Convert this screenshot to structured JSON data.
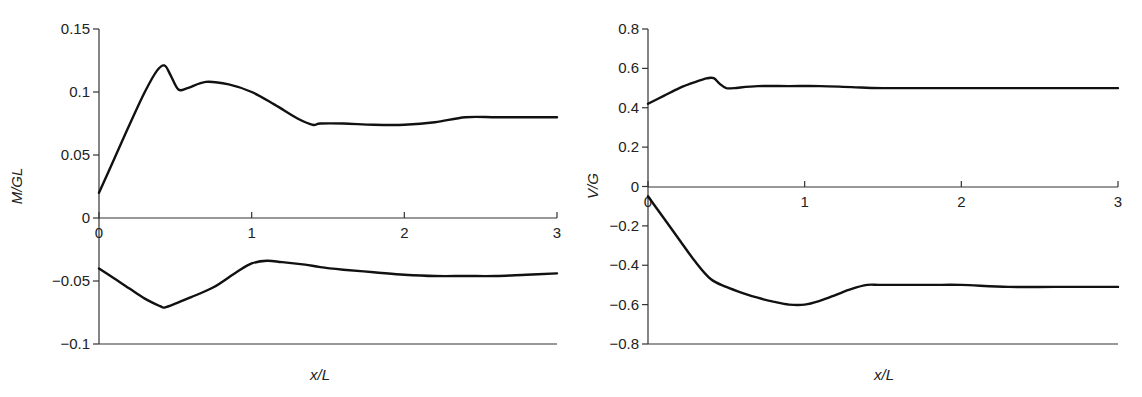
{
  "chart_data": [
    {
      "type": "line",
      "title": "",
      "xlabel": "x/L",
      "ylabel": "M/GL",
      "xlim": [
        0,
        3
      ],
      "ylim": [
        -0.1,
        0.15
      ],
      "x_ticks": [
        "0",
        "1",
        "2",
        "3"
      ],
      "y_ticks": [
        "0.15",
        "0.1",
        "0.05",
        "0",
        "−0.05",
        "−0.1"
      ],
      "grid": false,
      "legend": null,
      "series": [
        {
          "name": "upper",
          "x": [
            0,
            0.1,
            0.2,
            0.3,
            0.38,
            0.43,
            0.47,
            0.52,
            0.58,
            0.7,
            0.85,
            1.0,
            1.15,
            1.3,
            1.4,
            1.45,
            1.6,
            1.8,
            2.0,
            2.2,
            2.4,
            2.6,
            2.8,
            3.0
          ],
          "y": [
            0.02,
            0.047,
            0.074,
            0.1,
            0.117,
            0.121,
            0.113,
            0.102,
            0.103,
            0.108,
            0.106,
            0.1,
            0.09,
            0.079,
            0.074,
            0.075,
            0.075,
            0.074,
            0.074,
            0.076,
            0.08,
            0.08,
            0.08,
            0.08
          ]
        },
        {
          "name": "lower",
          "x": [
            0,
            0.1,
            0.2,
            0.3,
            0.4,
            0.43,
            0.5,
            0.6,
            0.75,
            0.9,
            1.0,
            1.1,
            1.2,
            1.35,
            1.45,
            1.6,
            1.8,
            2.0,
            2.2,
            2.4,
            2.6,
            2.8,
            3.0
          ],
          "y": [
            -0.04,
            -0.048,
            -0.056,
            -0.064,
            -0.07,
            -0.071,
            -0.068,
            -0.063,
            -0.055,
            -0.043,
            -0.036,
            -0.034,
            -0.035,
            -0.037,
            -0.039,
            -0.041,
            -0.043,
            -0.045,
            -0.046,
            -0.046,
            -0.046,
            -0.045,
            -0.044
          ]
        }
      ]
    },
    {
      "type": "line",
      "title": "",
      "xlabel": "x/L",
      "ylabel": "V/G",
      "xlim": [
        0,
        3
      ],
      "ylim": [
        -0.8,
        0.8
      ],
      "x_ticks": [
        "0",
        "1",
        "2",
        "3"
      ],
      "y_ticks": [
        "0.8",
        "0.6",
        "0.4",
        "0.2",
        "0",
        "−0.2",
        "−0.4",
        "−0.6",
        "−0.8"
      ],
      "grid": false,
      "legend": null,
      "series": [
        {
          "name": "upper",
          "x": [
            0,
            0.1,
            0.2,
            0.3,
            0.38,
            0.42,
            0.46,
            0.5,
            0.55,
            0.7,
            0.9,
            1.1,
            1.3,
            1.5,
            2.0,
            2.5,
            3.0
          ],
          "y": [
            0.42,
            0.46,
            0.5,
            0.53,
            0.55,
            0.55,
            0.52,
            0.5,
            0.5,
            0.51,
            0.51,
            0.51,
            0.505,
            0.5,
            0.5,
            0.5,
            0.5
          ]
        },
        {
          "name": "lower",
          "x": [
            0,
            0.1,
            0.2,
            0.3,
            0.4,
            0.5,
            0.6,
            0.7,
            0.8,
            0.9,
            1.0,
            1.1,
            1.2,
            1.3,
            1.4,
            1.5,
            1.8,
            2.0,
            2.3,
            2.6,
            3.0
          ],
          "y": [
            -0.05,
            -0.16,
            -0.27,
            -0.38,
            -0.47,
            -0.51,
            -0.54,
            -0.565,
            -0.585,
            -0.6,
            -0.6,
            -0.58,
            -0.55,
            -0.52,
            -0.5,
            -0.5,
            -0.5,
            -0.5,
            -0.51,
            -0.51,
            -0.51
          ]
        }
      ]
    }
  ],
  "charts": [
    {
      "xlabel_main": "x",
      "xlabel_sep": "/",
      "xlabel_den": "L",
      "ylabel": "M/GL"
    },
    {
      "xlabel_main": "x",
      "xlabel_sep": "/",
      "xlabel_den": "L",
      "ylabel": "V/G"
    }
  ]
}
